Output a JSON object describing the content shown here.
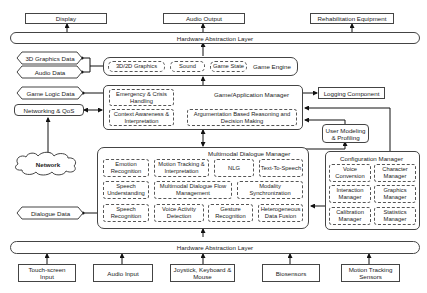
{
  "outputs": {
    "display": "Display",
    "audio_output": "Audio Output",
    "rehab_equipment": "Rehabilitation Equipment"
  },
  "hal_top": "Hardware Abstraction Layer",
  "hal_bottom": "Hardware Abstraction Layer",
  "data_stores": {
    "graphics_data": "3D Graphics Data",
    "audio_data": "Audio Data",
    "game_logic_data": "Game Logic Data",
    "dialogue_data": "Dialogue Data"
  },
  "networking": "Networking & QoS",
  "network": "Network",
  "game_engine": {
    "title": "Game Engine",
    "items": [
      "3D/2D Graphics",
      "Sound",
      "Game State"
    ]
  },
  "game_app_manager": {
    "title": "Game/Application Manager",
    "items": [
      "Emergency & Crisis Handling",
      "Context Awareness & Interpretation",
      "Argumentation Based Reasoning and Decision Making"
    ]
  },
  "logging": "Logging Component",
  "user_modeling": "User Modeling & Profiling",
  "dialogue_manager": {
    "title": "Multimodal Dialogue Manager",
    "items": [
      "Emotion Recognition",
      "Motion Tracking & Interpretation",
      "NLG",
      "Text-To-Speech",
      "Speech Understanding",
      "Multimodal Dialogue Flow Management",
      "Modality Synchronization",
      "Speech Recognition",
      "Voice Activity Detection",
      "Gesture Recognition",
      "Heterogeneous Data Fusion"
    ]
  },
  "config_manager": {
    "title": "Configuration Manager",
    "items": [
      "Voice Conversion",
      "Character Manager",
      "Interaction Manager",
      "Graphics Manager",
      "Calibration Manager",
      "Statistics Manager"
    ]
  },
  "inputs": {
    "touch": "Touch-screen Input",
    "audio": "Audio Input",
    "joystick": "Joystick, Keyboard & Mouse",
    "biosensors": "Biosensors",
    "motion": "Motion Tracking Sensors"
  }
}
